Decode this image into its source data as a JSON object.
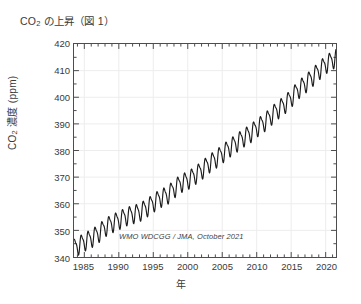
{
  "chart_data": {
    "type": "line",
    "title_main": "CO",
    "title_sub": "2",
    "title_rest": " の上昇（図 1）",
    "xlabel": "年",
    "ylabel": "CO₂ 濃度 (ppm)",
    "ylabel_main": "CO",
    "ylabel_sub": "2",
    "ylabel_rest": " 濃度 (ppm)",
    "annotation": "WMO WDCGG / JMA, October 2021",
    "grid": true,
    "grid_color": "#ededed",
    "line_color": "#1c1c1c",
    "axis_color": "#4d4d4d",
    "background": "#ffffff",
    "xlim": [
      1983.5,
      2021.5
    ],
    "ylim": [
      340,
      420
    ],
    "xticks": [
      1985,
      1990,
      1995,
      2000,
      2005,
      2010,
      2015,
      2020
    ],
    "xtick_labels": [
      "1985",
      "1990",
      "1995",
      "2000",
      "2005",
      "2010",
      "2015",
      "2020"
    ],
    "xminor_step": 1,
    "yticks": [
      340,
      350,
      360,
      370,
      380,
      390,
      400,
      410,
      420
    ],
    "ytick_labels": [
      "340",
      "350",
      "360",
      "370",
      "380",
      "390",
      "400",
      "410",
      "420"
    ],
    "series": [
      {
        "name": "Global mean CO2 concentration (monthly)",
        "units": "ppm",
        "seasonal_amplitude": 3.1,
        "x": [
          1984.0,
          1985.0,
          1986.0,
          1987.0,
          1988.0,
          1989.0,
          1990.0,
          1991.0,
          1992.0,
          1993.0,
          1994.0,
          1995.0,
          1996.0,
          1997.0,
          1998.0,
          1999.0,
          2000.0,
          2001.0,
          2002.0,
          2003.0,
          2004.0,
          2005.0,
          2006.0,
          2007.0,
          2008.0,
          2009.0,
          2010.0,
          2011.0,
          2012.0,
          2013.0,
          2014.0,
          2015.0,
          2016.0,
          2017.0,
          2018.0,
          2019.0,
          2020.0,
          2021.0
        ],
        "values": [
          344.3,
          345.9,
          347.2,
          348.9,
          351.3,
          352.8,
          354.0,
          355.4,
          356.2,
          357.0,
          358.6,
          360.5,
          362.3,
          363.3,
          365.8,
          367.9,
          369.0,
          370.8,
          372.7,
          375.1,
          376.9,
          378.9,
          381.1,
          382.9,
          384.9,
          386.4,
          388.7,
          390.5,
          392.9,
          395.4,
          397.3,
          399.9,
          403.0,
          405.1,
          407.5,
          410.1,
          412.5,
          414.2
        ]
      }
    ]
  }
}
